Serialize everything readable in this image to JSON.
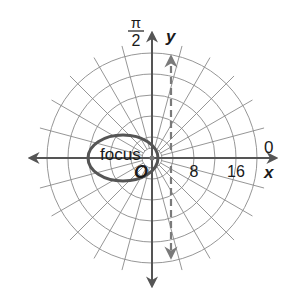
{
  "labels": {
    "angle_top_numerator": "π",
    "angle_top_denominator": "2",
    "angle_right": "0",
    "y_axis": "y",
    "x_axis": "x",
    "origin": "O",
    "focus": "focus",
    "tick_8": "8",
    "tick_16": "16"
  },
  "colors": {
    "grid": "#8a8a8a",
    "axis": "#555555",
    "curve": "#555555",
    "directrix": "#7a7a7a",
    "text": "#1a1a1a"
  },
  "grid": {
    "ring_spacing_units": 4,
    "ring_count": 5,
    "radial_step_degrees": 15
  },
  "curve": {
    "type": "ellipse",
    "focus": "pole",
    "directrix": "x = 4 (dashed vertical line)"
  }
}
